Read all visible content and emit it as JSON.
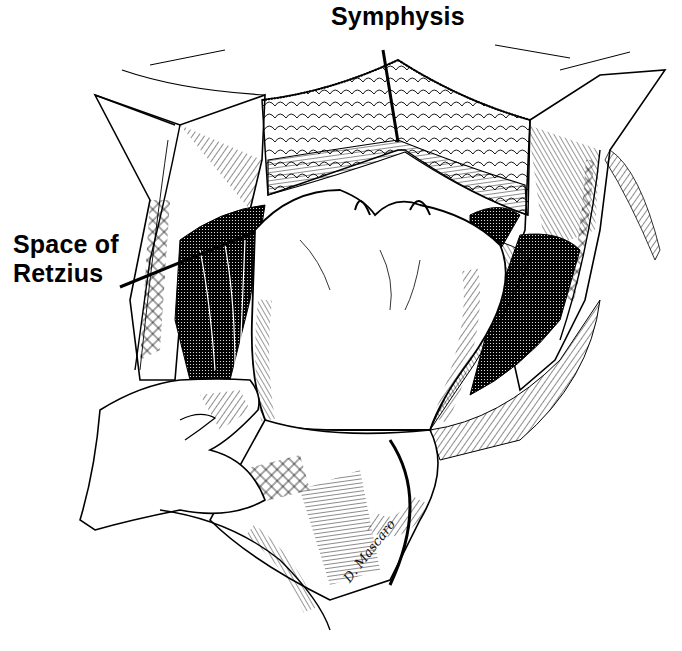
{
  "figure": {
    "type": "surgical illustration",
    "style": "black and white pen-and-ink"
  },
  "labels": {
    "symphysis": "Symphysis",
    "retzius_line1": "Space of",
    "retzius_line2": "Retzius"
  },
  "leader_lines": {
    "symphysis": {
      "x1": 383,
      "y1": 50,
      "x2": 398,
      "y2": 142
    },
    "retzius": {
      "x1": 120,
      "y1": 287,
      "x2": 255,
      "y2": 232
    }
  },
  "signature": "D. Mascaro",
  "colors": {
    "ink": "#000000",
    "paper": "#ffffff"
  }
}
